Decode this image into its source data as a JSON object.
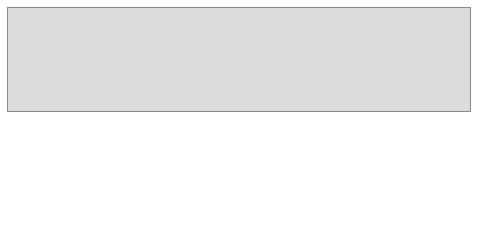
{
  "diagram": {
    "part_a": {
      "top_box": "Student\nrecord",
      "bottom_box": "Class\nrecord",
      "caption_letter": "a.",
      "caption_line1": "Student/class",
      "caption_line2": "relationship"
    },
    "part_b": {
      "students": [
        "Student\nAble",
        "Student\nBaker",
        "Student\nCharlene"
      ],
      "classes": [
        "Math 100\nclass",
        "English 100\nclass",
        "Accounting\n100 class",
        "Computer\n100 class"
      ],
      "caption_letter": "b.",
      "caption_text": "Student/class occurrence",
      "links": [
        [
          "Student Able",
          "Math 100 class"
        ],
        [
          "Student Able",
          "English 100 class"
        ],
        [
          "Student Baker",
          "English 100 class"
        ],
        [
          "Student Baker",
          "Computer 100 class"
        ],
        [
          "Student Charlene",
          "Math 100 class"
        ],
        [
          "Student Charlene",
          "Accounting 100 class"
        ],
        [
          "Student Charlene",
          "Computer 100 class"
        ]
      ]
    }
  }
}
